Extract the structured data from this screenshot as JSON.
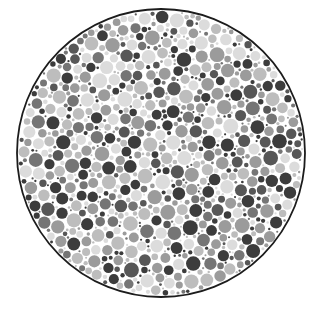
{
  "figure": {
    "kind": "ishihara-pseudoisochromatic-plate",
    "title": "Ishihara test plate (grayscale)",
    "caption": "",
    "width": 323,
    "height": 310,
    "background_color": "#ffffff"
  },
  "plate": {
    "center_x": 161,
    "center_y": 153,
    "radius": 144,
    "fill_color": "#ffffff",
    "border_color": "#1c1c1c",
    "border_width": 1.8,
    "hidden_numeral": "",
    "numeral_visible": false
  },
  "dots": {
    "count_approx": 1150,
    "min_diameter": 2,
    "max_diameter": 15,
    "mean_diameter": 7.2,
    "gap": 0.6,
    "seed": 20240517,
    "palette": [
      {
        "name": "dark",
        "color": "#3c3c3c",
        "weight": 0.2
      },
      {
        "name": "dark-mid",
        "color": "#575757",
        "weight": 0.1
      },
      {
        "name": "mid",
        "color": "#757575",
        "weight": 0.13
      },
      {
        "name": "mid-light",
        "color": "#9b9b9b",
        "weight": 0.17
      },
      {
        "name": "light",
        "color": "#bdbdbd",
        "weight": 0.22
      },
      {
        "name": "very-light",
        "color": "#dcdcdc",
        "weight": 0.18
      }
    ],
    "size_bands": [
      {
        "name": "tiny",
        "min": 2,
        "max": 4,
        "weight": 0.2
      },
      {
        "name": "small",
        "min": 4,
        "max": 6.5,
        "weight": 0.28
      },
      {
        "name": "medium",
        "min": 6.5,
        "max": 9.5,
        "weight": 0.29
      },
      {
        "name": "large",
        "min": 9.5,
        "max": 12.5,
        "weight": 0.16
      },
      {
        "name": "xlarge",
        "min": 12.5,
        "max": 15,
        "weight": 0.07
      }
    ]
  }
}
